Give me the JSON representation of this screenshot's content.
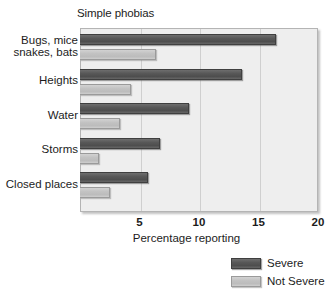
{
  "chart_data": {
    "type": "bar",
    "orientation": "horizontal",
    "title": "Simple phobias",
    "xlabel": "Percentage reporting",
    "ylabel": "",
    "xlim": [
      0,
      20
    ],
    "xticks": [
      5,
      10,
      15,
      20
    ],
    "xtick_labels": [
      "5",
      "10",
      "15",
      "20"
    ],
    "grid": true,
    "grid_axis": "x",
    "legend_position": "bottom-right",
    "categories": [
      "Bugs, mice snakes, bats",
      "Heights",
      "Water",
      "Storms",
      "Closed places"
    ],
    "category_lines": [
      [
        "Bugs, mice",
        "snakes, bats"
      ],
      [
        "Heights"
      ],
      [
        "Water"
      ],
      [
        "Storms"
      ],
      [
        "Closed places"
      ]
    ],
    "series": [
      {
        "name": "Severe",
        "color": "#555555",
        "values": [
          16.5,
          13.6,
          9.2,
          6.7,
          5.7
        ]
      },
      {
        "name": "Not Severe",
        "color": "#c4c4c4",
        "values": [
          6.4,
          4.3,
          3.4,
          1.6,
          2.5
        ]
      }
    ]
  },
  "legend": {
    "items": [
      {
        "label": "Severe",
        "swatch": "severe-swatch"
      },
      {
        "label": "Not Severe",
        "swatch": "not-severe-swatch"
      }
    ]
  },
  "colors": {
    "plot_background": "#eeeeee",
    "plot_border": "#b4b4b4",
    "gridline": "#cfcfcf",
    "severe": "#555555",
    "not_severe": "#c4c4c4",
    "text": "#1c1c1c"
  }
}
